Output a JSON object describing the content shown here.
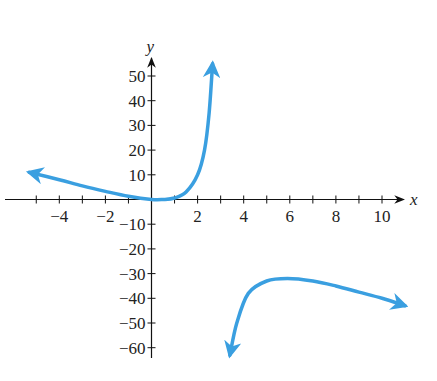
{
  "chart_data": {
    "type": "line",
    "title": "",
    "xlabel": "x",
    "ylabel": "y",
    "xlim": [
      -5.3,
      10.8
    ],
    "ylim": [
      -63,
      57
    ],
    "grid": false,
    "legend": null,
    "x_ticks": [
      -5,
      -4,
      -3,
      -2,
      -1,
      1,
      2,
      3,
      4,
      5,
      6,
      7,
      8,
      9,
      10
    ],
    "x_tick_labels": [
      {
        "value": -4,
        "label": "−4"
      },
      {
        "value": -2,
        "label": "−2"
      },
      {
        "value": 2,
        "label": "2"
      },
      {
        "value": 4,
        "label": "4"
      },
      {
        "value": 6,
        "label": "6"
      },
      {
        "value": 8,
        "label": "8"
      },
      {
        "value": 10,
        "label": "10"
      }
    ],
    "y_ticks": [
      -60,
      -50,
      -40,
      -30,
      -20,
      -10,
      10,
      20,
      30,
      40,
      50
    ],
    "y_tick_labels": [
      {
        "value": 50,
        "label": "50"
      },
      {
        "value": 40,
        "label": "40"
      },
      {
        "value": 30,
        "label": "30"
      },
      {
        "value": 20,
        "label": "20"
      },
      {
        "value": 10,
        "label": "10"
      },
      {
        "value": -10,
        "label": "−10"
      },
      {
        "value": -20,
        "label": "−20"
      },
      {
        "value": -30,
        "label": "−30"
      },
      {
        "value": -40,
        "label": "−40"
      },
      {
        "value": -50,
        "label": "−50"
      },
      {
        "value": -60,
        "label": "−60"
      }
    ],
    "vertical_asymptote": 3,
    "series": [
      {
        "name": "left branch",
        "color": "#3a9fe0",
        "arrows": "both ends",
        "x": [
          -5.3,
          -4,
          -3,
          -2,
          -1,
          0,
          0.5,
          1,
          1.5,
          2,
          2.3,
          2.5,
          2.65
        ],
        "y": [
          11,
          8,
          5.5,
          3.3,
          1.3,
          0,
          0,
          0.6,
          3,
          10,
          20,
          35,
          55
        ]
      },
      {
        "name": "right branch",
        "color": "#3a9fe0",
        "arrows": "both ends",
        "x": [
          3.4,
          3.7,
          4.2,
          5,
          5.9,
          7,
          8,
          9,
          10,
          11
        ],
        "y": [
          -63,
          -50,
          -38,
          -33,
          -32,
          -33,
          -35,
          -37.5,
          -40,
          -43
        ]
      }
    ]
  }
}
